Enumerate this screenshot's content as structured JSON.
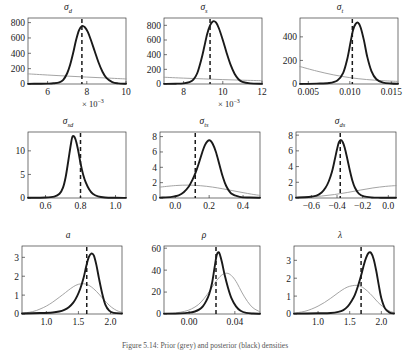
{
  "figure": {
    "rows": 3,
    "cols": 3,
    "caption": "Figure 5.14: Prior (grey) and posterior (black) densities",
    "colors": {
      "posterior": "#1a1a1a",
      "prior": "#9a9a9a",
      "mode_line": "#1a1a1a",
      "axis": "#3a3a3a",
      "background": "#ffffff"
    },
    "legend_note": "thick black = posterior, thin grey = prior, dashed vertical = posterior mode"
  },
  "chart_data": [
    {
      "id": "panel-sigma-d",
      "type": "line",
      "title": "σ",
      "title_sub": "d",
      "xlabel": "× 10",
      "xlabel_exp": "−3",
      "ylabel": "",
      "xlim": [
        5,
        10
      ],
      "ylim": [
        0,
        860
      ],
      "xticks": [
        6,
        8,
        10
      ],
      "xticklabels": [
        "6",
        "8",
        "10"
      ],
      "yticks": [
        0,
        200,
        400,
        600,
        800
      ],
      "yticklabels": [
        "0",
        "200",
        "400",
        "600",
        "800"
      ],
      "grid": false,
      "mode": 7.75,
      "series": [
        {
          "name": "posterior",
          "color": "#1a1a1a",
          "x": [
            5.0,
            5.5,
            6.0,
            6.3,
            6.6,
            6.8,
            7.0,
            7.15,
            7.3,
            7.45,
            7.6,
            7.75,
            7.9,
            8.05,
            8.2,
            8.4,
            8.6,
            8.8,
            9.0,
            9.3,
            9.6,
            10.0
          ],
          "y": [
            2,
            3,
            5,
            9,
            22,
            55,
            140,
            250,
            400,
            570,
            700,
            755,
            740,
            680,
            580,
            430,
            280,
            160,
            80,
            25,
            8,
            3
          ]
        },
        {
          "name": "prior",
          "color": "#9a9a9a",
          "x": [
            5.0,
            6.0,
            7.0,
            8.0,
            9.0,
            10.0
          ],
          "y": [
            132,
            117,
            103,
            90,
            78,
            66
          ]
        }
      ]
    },
    {
      "id": "panel-sigma-s",
      "type": "line",
      "title": "σ",
      "title_sub": "s",
      "xlabel": "× 10",
      "xlabel_exp": "−3",
      "ylabel": "",
      "xlim": [
        7,
        12
      ],
      "ylim": [
        0,
        900
      ],
      "xticks": [
        8,
        10,
        12
      ],
      "xticklabels": [
        "8",
        "10",
        "12"
      ],
      "yticks": [
        0,
        200,
        400,
        600,
        800
      ],
      "yticklabels": [
        "0",
        "200",
        "400",
        "600",
        "800"
      ],
      "grid": false,
      "mode": 9.35,
      "series": [
        {
          "name": "posterior",
          "color": "#1a1a1a",
          "x": [
            7.0,
            7.6,
            8.0,
            8.3,
            8.5,
            8.7,
            8.9,
            9.05,
            9.2,
            9.35,
            9.5,
            9.65,
            9.8,
            10.0,
            10.2,
            10.4,
            10.6,
            10.8,
            11.0,
            11.4,
            12.0
          ],
          "y": [
            2,
            4,
            9,
            25,
            60,
            150,
            330,
            500,
            680,
            800,
            855,
            840,
            760,
            600,
            420,
            260,
            140,
            65,
            28,
            8,
            2
          ]
        },
        {
          "name": "prior",
          "color": "#9a9a9a",
          "x": [
            7.0,
            8.0,
            9.0,
            10.0,
            11.0,
            12.0
          ],
          "y": [
            92,
            80,
            70,
            60,
            52,
            45
          ]
        }
      ]
    },
    {
      "id": "panel-sigma-t",
      "type": "line",
      "title": "σ",
      "title_sub": "t",
      "xlabel": "",
      "xlabel_exp": "",
      "ylabel": "",
      "xlim": [
        0.004,
        0.0158
      ],
      "ylim": [
        0,
        560
      ],
      "xticks": [
        0.005,
        0.01,
        0.015
      ],
      "xticklabels": [
        "0.005",
        "0.010",
        "0.015"
      ],
      "yticks": [
        0,
        200,
        400
      ],
      "yticklabels": [
        "0",
        "200",
        "400"
      ],
      "grid": false,
      "mode": 0.0103,
      "series": [
        {
          "name": "posterior",
          "color": "#1a1a1a",
          "x": [
            0.004,
            0.006,
            0.0075,
            0.0085,
            0.0092,
            0.0097,
            0.0101,
            0.0104,
            0.0107,
            0.011,
            0.0113,
            0.0117,
            0.0121,
            0.0126,
            0.0132,
            0.014,
            0.015,
            0.0158
          ],
          "y": [
            1,
            3,
            8,
            30,
            95,
            215,
            360,
            460,
            510,
            520,
            480,
            370,
            230,
            110,
            40,
            12,
            4,
            2
          ]
        },
        {
          "name": "prior",
          "color": "#9a9a9a",
          "x": [
            0.004,
            0.006,
            0.008,
            0.01,
            0.012,
            0.014,
            0.0158
          ],
          "y": [
            148,
            110,
            78,
            54,
            38,
            28,
            22
          ]
        }
      ]
    },
    {
      "id": "panel-sigma-sd",
      "type": "line",
      "title": "σ",
      "title_sub": "sd",
      "xlabel": "",
      "xlabel_exp": "",
      "ylabel": "",
      "xlim": [
        0.5,
        1.06
      ],
      "ylim": [
        0,
        14
      ],
      "xticks": [
        0.6,
        0.8,
        1.0
      ],
      "xticklabels": [
        "0.6",
        "0.8",
        "1.0"
      ],
      "yticks": [
        0,
        5,
        10
      ],
      "yticklabels": [
        "0",
        "5",
        "10"
      ],
      "grid": false,
      "mode": 0.8,
      "series": [
        {
          "name": "posterior",
          "color": "#1a1a1a",
          "x": [
            0.5,
            0.6,
            0.65,
            0.68,
            0.7,
            0.715,
            0.73,
            0.745,
            0.755,
            0.77,
            0.785,
            0.8,
            0.815,
            0.83,
            0.85,
            0.87,
            0.9,
            0.94,
            1.0,
            1.06
          ],
          "y": [
            0.05,
            0.1,
            0.3,
            0.9,
            2.2,
            4.4,
            7.8,
            11.4,
            13.1,
            12.6,
            10.4,
            7.4,
            5.0,
            3.3,
            1.8,
            0.9,
            0.35,
            0.12,
            0.05,
            0.03
          ]
        }
      ]
    },
    {
      "id": "panel-sigma-ts",
      "type": "line",
      "title": "σ",
      "title_sub": "ts",
      "xlabel": "",
      "xlabel_exp": "",
      "ylabel": "",
      "xlim": [
        -0.09,
        0.5
      ],
      "ylim": [
        0,
        8.6
      ],
      "xticks": [
        0.0,
        0.2,
        0.4
      ],
      "xticklabels": [
        "0.0",
        "0.2",
        "0.4"
      ],
      "yticks": [
        0,
        2,
        4,
        6,
        8
      ],
      "yticklabels": [
        "0",
        "2",
        "4",
        "6",
        "8"
      ],
      "grid": false,
      "mode": 0.118,
      "series": [
        {
          "name": "posterior",
          "color": "#1a1a1a",
          "x": [
            -0.09,
            -0.02,
            0.02,
            0.05,
            0.08,
            0.1,
            0.12,
            0.14,
            0.16,
            0.175,
            0.19,
            0.205,
            0.22,
            0.24,
            0.26,
            0.28,
            0.3,
            0.33,
            0.38,
            0.44,
            0.5
          ],
          "y": [
            0.05,
            0.15,
            0.35,
            0.75,
            1.5,
            2.3,
            3.3,
            4.6,
            6.0,
            6.9,
            7.4,
            7.5,
            7.1,
            6.0,
            4.4,
            2.8,
            1.6,
            0.6,
            0.15,
            0.06,
            0.04
          ]
        },
        {
          "name": "prior",
          "color": "#9a9a9a",
          "x": [
            -0.09,
            0.0,
            0.08,
            0.15,
            0.22,
            0.28,
            0.34,
            0.4,
            0.45,
            0.5
          ],
          "y": [
            1.42,
            1.62,
            1.68,
            1.6,
            1.42,
            1.2,
            0.95,
            0.7,
            0.5,
            0.34
          ]
        }
      ]
    },
    {
      "id": "panel-sigma-ds",
      "type": "line",
      "title": "σ",
      "title_sub": "ds",
      "xlabel": "",
      "xlabel_exp": "",
      "ylabel": "",
      "xlim": [
        -0.72,
        0.06
      ],
      "ylim": [
        0,
        8.4
      ],
      "xticks": [
        -0.6,
        -0.4,
        -0.2,
        0.0
      ],
      "xticklabels": [
        "−0.6",
        "−0.4",
        "−0.2",
        "0.0"
      ],
      "yticks": [
        0,
        2,
        4,
        6,
        8
      ],
      "yticklabels": [
        "0",
        "2",
        "4",
        "6",
        "8"
      ],
      "grid": false,
      "mode": -0.375,
      "series": [
        {
          "name": "posterior",
          "color": "#1a1a1a",
          "x": [
            -0.72,
            -0.62,
            -0.56,
            -0.52,
            -0.49,
            -0.465,
            -0.44,
            -0.42,
            -0.4,
            -0.385,
            -0.37,
            -0.355,
            -0.34,
            -0.32,
            -0.3,
            -0.28,
            -0.26,
            -0.23,
            -0.19,
            -0.13,
            -0.06,
            0.06
          ],
          "y": [
            0.05,
            0.12,
            0.3,
            0.7,
            1.3,
            2.1,
            3.3,
            4.7,
            6.2,
            7.1,
            7.4,
            7.1,
            6.4,
            5.0,
            3.5,
            2.2,
            1.3,
            0.55,
            0.2,
            0.07,
            0.04,
            0.03
          ]
        },
        {
          "name": "prior",
          "color": "#9a9a9a",
          "x": [
            -0.72,
            -0.62,
            -0.52,
            -0.42,
            -0.32,
            -0.22,
            -0.12,
            -0.02,
            0.06
          ],
          "y": [
            0.06,
            0.13,
            0.25,
            0.44,
            0.7,
            1.0,
            1.28,
            1.48,
            1.58
          ]
        }
      ]
    },
    {
      "id": "panel-a",
      "type": "line",
      "title": "a",
      "title_sub": "",
      "xlabel": "",
      "xlabel_exp": "",
      "ylabel": "",
      "xlim": [
        0.62,
        2.18
      ],
      "ylim": [
        0,
        3.6
      ],
      "xticks": [
        1.0,
        1.5,
        2.0
      ],
      "xticklabels": [
        "1.0",
        "1.5",
        "2.0"
      ],
      "yticks": [
        0,
        1,
        2,
        3
      ],
      "yticklabels": [
        "0",
        "1",
        "2",
        "3"
      ],
      "grid": false,
      "mode": 1.63,
      "series": [
        {
          "name": "posterior",
          "color": "#1a1a1a",
          "x": [
            0.62,
            0.9,
            1.1,
            1.2,
            1.28,
            1.35,
            1.42,
            1.48,
            1.53,
            1.58,
            1.62,
            1.66,
            1.7,
            1.74,
            1.78,
            1.82,
            1.87,
            1.92,
            1.98,
            2.05,
            2.18
          ],
          "y": [
            0.03,
            0.05,
            0.08,
            0.13,
            0.22,
            0.36,
            0.6,
            0.95,
            1.35,
            1.9,
            2.5,
            3.0,
            3.2,
            3.1,
            2.6,
            1.9,
            1.1,
            0.5,
            0.18,
            0.06,
            0.03
          ]
        },
        {
          "name": "prior",
          "color": "#9a9a9a",
          "x": [
            0.62,
            0.78,
            0.9,
            1.0,
            1.1,
            1.2,
            1.3,
            1.38,
            1.46,
            1.54,
            1.62,
            1.7,
            1.78,
            1.86,
            1.94,
            2.02,
            2.1,
            2.18
          ],
          "y": [
            0.04,
            0.12,
            0.26,
            0.42,
            0.63,
            0.88,
            1.14,
            1.35,
            1.52,
            1.6,
            1.58,
            1.44,
            1.2,
            0.9,
            0.6,
            0.35,
            0.18,
            0.09
          ]
        }
      ]
    },
    {
      "id": "panel-rho",
      "type": "line",
      "title": "ρ",
      "title_sub": "",
      "xlabel": "",
      "xlabel_exp": "",
      "ylabel": "",
      "xlim": [
        -0.022,
        0.062
      ],
      "ylim": [
        0,
        62
      ],
      "xticks": [
        0.0,
        0.04
      ],
      "xticklabels": [
        "0.00",
        "0.04"
      ],
      "yticks": [
        0,
        20,
        40,
        60
      ],
      "yticklabels": [
        "0",
        "20",
        "40",
        "60"
      ],
      "grid": false,
      "mode": 0.0235,
      "series": [
        {
          "name": "posterior",
          "color": "#1a1a1a",
          "x": [
            -0.022,
            -0.008,
            0.0,
            0.005,
            0.009,
            0.012,
            0.015,
            0.0175,
            0.02,
            0.0222,
            0.0242,
            0.0262,
            0.0285,
            0.031,
            0.034,
            0.037,
            0.041,
            0.045,
            0.05,
            0.056,
            0.062
          ],
          "y": [
            0.3,
            0.6,
            1.2,
            2.3,
            4.2,
            7.0,
            12.0,
            18.0,
            28.0,
            42.0,
            54.0,
            56.0,
            48.0,
            36.0,
            24.0,
            14.5,
            7.0,
            3.0,
            1.0,
            0.4,
            0.2
          ]
        },
        {
          "name": "prior",
          "color": "#9a9a9a",
          "x": [
            -0.022,
            -0.012,
            -0.004,
            0.002,
            0.008,
            0.013,
            0.018,
            0.022,
            0.026,
            0.03,
            0.034,
            0.038,
            0.042,
            0.046,
            0.051,
            0.056,
            0.062
          ],
          "y": [
            0.4,
            1.0,
            2.4,
            4.6,
            8.5,
            14.0,
            21.0,
            27.5,
            33.0,
            36.5,
            37.0,
            34.0,
            28.0,
            20.0,
            11.5,
            5.5,
            2.0
          ]
        }
      ]
    },
    {
      "id": "panel-lambda",
      "type": "line",
      "title": "λ",
      "title_sub": "",
      "xlabel": "",
      "xlabel_exp": "",
      "ylabel": "",
      "xlim": [
        0.62,
        2.2
      ],
      "ylim": [
        0,
        3.8
      ],
      "xticks": [
        1.0,
        1.5,
        2.0
      ],
      "xticklabels": [
        "1.0",
        "1.5",
        "2.0"
      ],
      "yticks": [
        0,
        1,
        2,
        3
      ],
      "yticklabels": [
        "0",
        "1",
        "2",
        "3"
      ],
      "grid": false,
      "mode": 1.68,
      "series": [
        {
          "name": "posterior",
          "color": "#1a1a1a",
          "x": [
            0.62,
            1.0,
            1.2,
            1.32,
            1.4,
            1.47,
            1.53,
            1.58,
            1.63,
            1.68,
            1.72,
            1.76,
            1.8,
            1.84,
            1.88,
            1.92,
            1.96,
            2.0,
            2.06,
            2.13,
            2.2
          ],
          "y": [
            0.02,
            0.04,
            0.06,
            0.12,
            0.22,
            0.42,
            0.72,
            1.05,
            1.55,
            2.15,
            2.7,
            3.15,
            3.42,
            3.4,
            3.05,
            2.4,
            1.6,
            0.88,
            0.3,
            0.08,
            0.03
          ]
        },
        {
          "name": "prior",
          "color": "#9a9a9a",
          "x": [
            0.62,
            0.78,
            0.9,
            1.0,
            1.1,
            1.2,
            1.3,
            1.38,
            1.46,
            1.54,
            1.62,
            1.7,
            1.78,
            1.86,
            1.94,
            2.02,
            2.12,
            2.2
          ],
          "y": [
            0.05,
            0.14,
            0.28,
            0.44,
            0.64,
            0.88,
            1.14,
            1.34,
            1.5,
            1.58,
            1.6,
            1.5,
            1.28,
            1.0,
            0.68,
            0.42,
            0.18,
            0.08
          ]
        }
      ]
    }
  ]
}
